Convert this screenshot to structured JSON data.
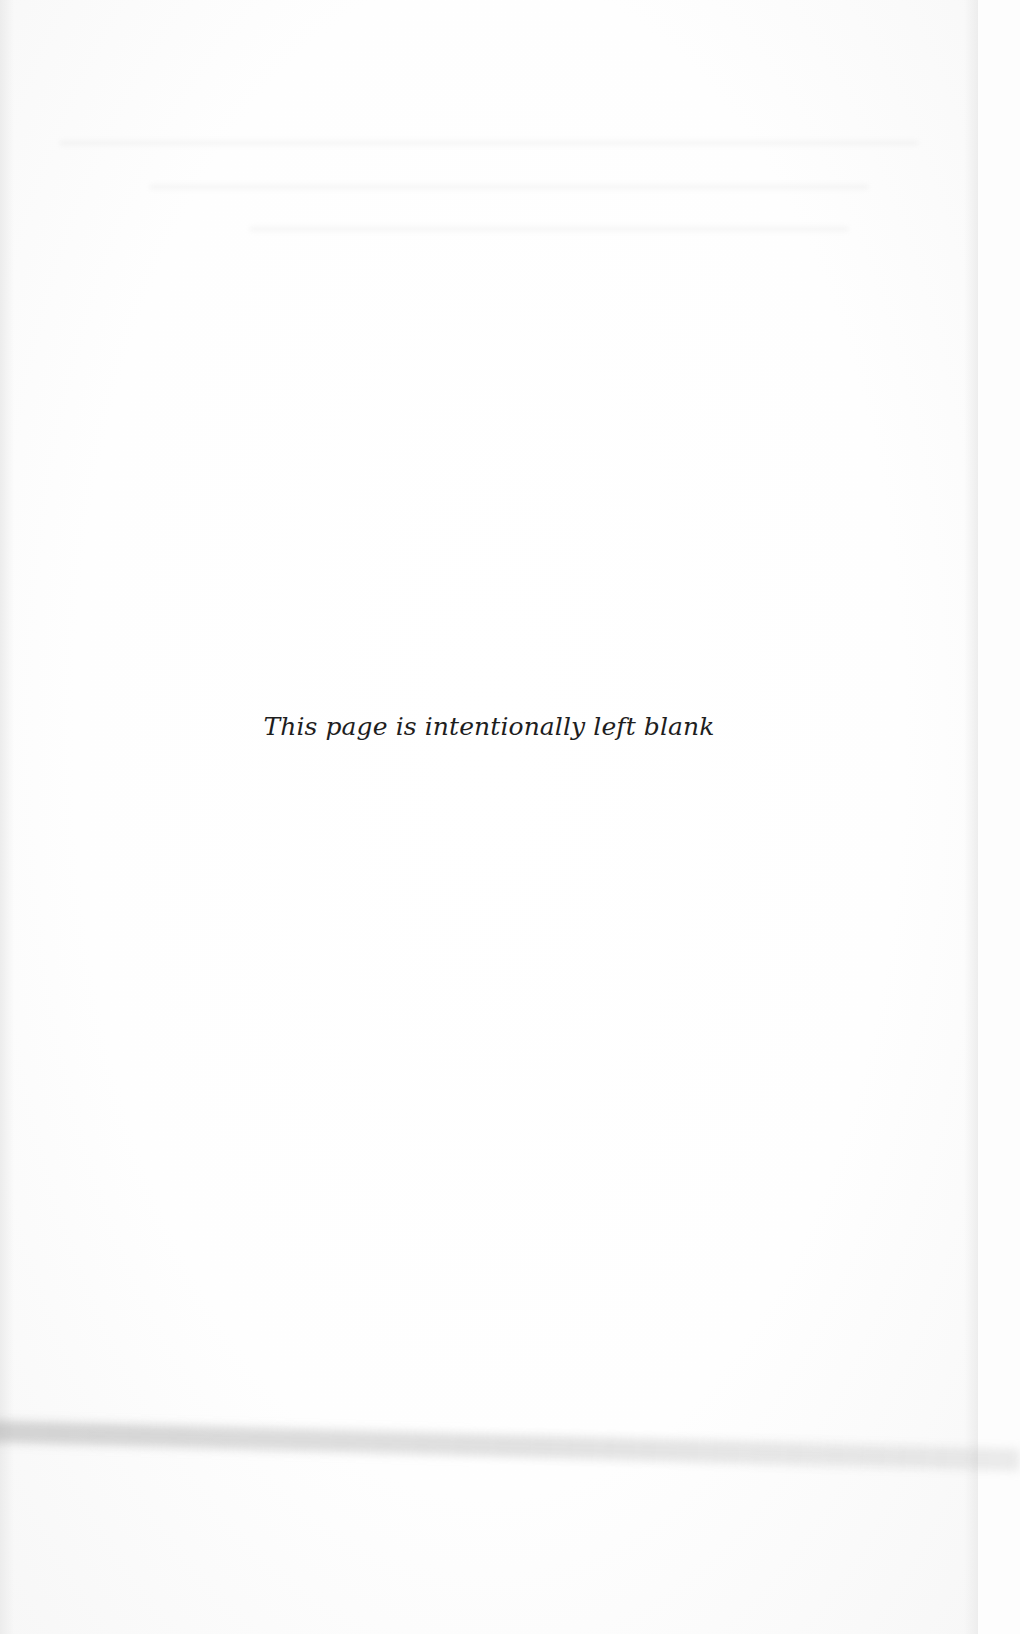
{
  "document": {
    "page_type": "blank",
    "notice_text": "This page is intentionally left blank"
  }
}
